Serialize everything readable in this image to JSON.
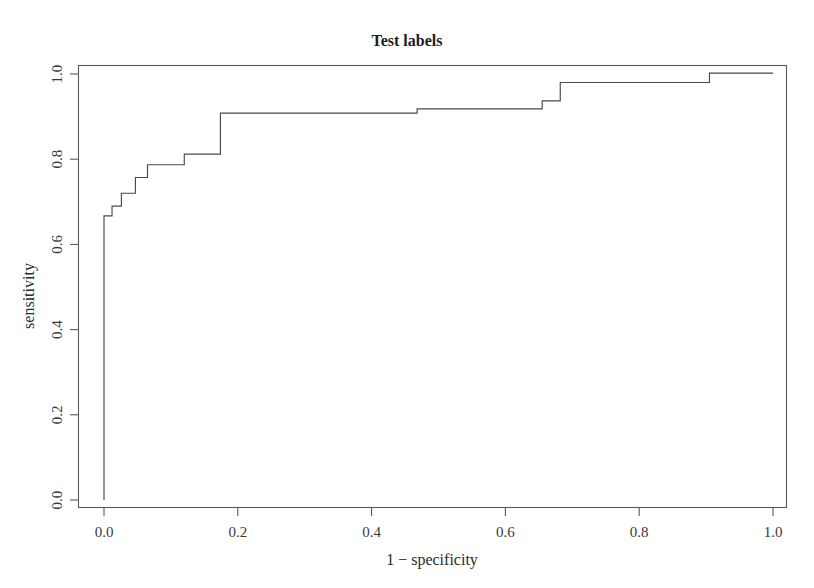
{
  "chart_data": {
    "type": "line",
    "title": "Test labels",
    "xlabel": "1 − specificity",
    "ylabel": "sensitivity",
    "xlim": [
      0.0,
      1.0
    ],
    "ylim": [
      0.0,
      1.0
    ],
    "grid": false,
    "legend": "none",
    "xticks": [
      0.0,
      0.2,
      0.4,
      0.6,
      0.8,
      1.0
    ],
    "yticks": [
      0.0,
      0.2,
      0.4,
      0.6,
      0.8,
      1.0
    ],
    "xtick_labels": [
      "0.0",
      "0.2",
      "0.4",
      "0.6",
      "0.8",
      "1.0"
    ],
    "ytick_labels": [
      "0.0",
      "0.2",
      "0.4",
      "0.6",
      "0.8",
      "1.0"
    ],
    "line_color": "#4a4a4a",
    "drawstyle": "steps-post",
    "series": [
      {
        "name": "ROC curve",
        "x": [
          0.0,
          0.0,
          0.012,
          0.012,
          0.026,
          0.026,
          0.047,
          0.047,
          0.065,
          0.065,
          0.088,
          0.088,
          0.12,
          0.12,
          0.174,
          0.174,
          0.468,
          0.468,
          0.655,
          0.655,
          0.682,
          0.682,
          0.905,
          0.905,
          1.0
        ],
        "y": [
          0.0,
          0.667,
          0.667,
          0.69,
          0.69,
          0.72,
          0.72,
          0.757,
          0.757,
          0.787,
          0.787,
          0.787,
          0.787,
          0.812,
          0.812,
          0.908,
          0.908,
          0.918,
          0.918,
          0.937,
          0.937,
          0.98,
          0.98,
          1.002,
          1.002
        ]
      }
    ]
  },
  "axes": {
    "title": "Test labels",
    "x_axis_title": "1 − specificity",
    "y_axis_title": "sensitivity",
    "x_tick_labels": [
      "0.0",
      "0.2",
      "0.4",
      "0.6",
      "0.8",
      "1.0"
    ],
    "y_tick_labels": [
      "0.0",
      "0.2",
      "0.4",
      "0.6",
      "0.8",
      "1.0"
    ]
  }
}
